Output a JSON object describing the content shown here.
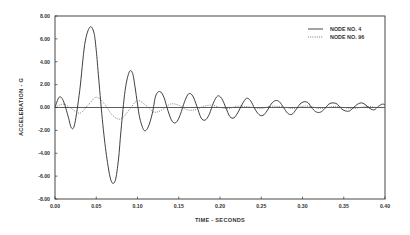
{
  "chart_data": {
    "type": "line",
    "title": "",
    "xlabel": "TIME - SECONDS",
    "ylabel": "ACCELERATION - G",
    "xlim": [
      0.0,
      0.4
    ],
    "ylim": [
      -8.0,
      8.0
    ],
    "grid": false,
    "legend_position": "upper right",
    "x_ticks": [
      "0.00",
      "0.05",
      "0.10",
      "0.15",
      "0.20",
      "0.25",
      "0.30",
      "0.35",
      "0.40"
    ],
    "y_ticks": [
      "8.00",
      "6.00",
      "4.00",
      "2.00",
      "0.00",
      "-2.00",
      "-4.00",
      "-6.00",
      "-8.00"
    ],
    "series": [
      {
        "name": "NODE NO. 4",
        "style": "solid",
        "x": [
          0.0,
          0.005,
          0.01,
          0.016,
          0.02,
          0.024,
          0.03,
          0.036,
          0.042,
          0.047,
          0.05,
          0.053,
          0.058,
          0.063,
          0.068,
          0.073,
          0.077,
          0.08,
          0.085,
          0.09,
          0.094,
          0.097,
          0.1,
          0.103,
          0.108,
          0.113,
          0.118,
          0.122,
          0.127,
          0.132,
          0.137,
          0.142,
          0.147,
          0.152,
          0.157,
          0.162,
          0.167,
          0.172,
          0.177,
          0.182,
          0.187,
          0.192,
          0.197,
          0.202,
          0.207,
          0.212,
          0.217,
          0.222,
          0.227,
          0.232,
          0.237,
          0.242,
          0.247,
          0.252,
          0.257,
          0.262,
          0.267,
          0.272,
          0.277,
          0.282,
          0.287,
          0.292,
          0.297,
          0.302,
          0.307,
          0.312,
          0.317,
          0.322,
          0.327,
          0.332,
          0.337,
          0.342,
          0.347,
          0.352,
          0.357,
          0.362,
          0.367,
          0.372,
          0.377,
          0.382,
          0.387,
          0.392,
          0.397,
          0.4
        ],
        "y": [
          0.0,
          0.9,
          0.6,
          -0.8,
          -1.8,
          -1.4,
          1.5,
          5.5,
          7.0,
          6.6,
          5.0,
          2.5,
          -1.5,
          -4.5,
          -6.4,
          -6.4,
          -4.5,
          -2.0,
          1.5,
          3.1,
          3.0,
          1.8,
          0.3,
          -1.0,
          -2.0,
          -1.7,
          -0.5,
          1.0,
          1.4,
          0.9,
          -0.3,
          -1.2,
          -1.3,
          -0.6,
          0.5,
          1.2,
          1.0,
          0.1,
          -0.9,
          -1.1,
          -0.6,
          0.4,
          1.0,
          0.8,
          0.0,
          -0.8,
          -0.9,
          -0.4,
          0.3,
          0.8,
          0.6,
          -0.1,
          -0.6,
          -0.7,
          -0.3,
          0.3,
          0.6,
          0.5,
          0.0,
          -0.5,
          -0.6,
          -0.2,
          0.3,
          0.5,
          0.4,
          -0.1,
          -0.4,
          -0.4,
          -0.1,
          0.3,
          0.4,
          0.3,
          -0.1,
          -0.3,
          -0.3,
          0.0,
          0.3,
          0.4,
          0.2,
          -0.1,
          -0.2,
          0.1,
          0.3,
          0.2
        ]
      },
      {
        "name": "NODE NO. 96",
        "style": "dotted",
        "x": [
          0.0,
          0.01,
          0.02,
          0.03,
          0.04,
          0.05,
          0.06,
          0.07,
          0.08,
          0.09,
          0.1,
          0.11,
          0.12,
          0.13,
          0.14,
          0.15,
          0.16,
          0.17,
          0.18,
          0.19,
          0.2,
          0.21,
          0.22,
          0.23,
          0.24,
          0.25,
          0.26,
          0.27,
          0.28,
          0.29,
          0.3,
          0.31,
          0.32,
          0.33,
          0.34,
          0.35,
          0.36,
          0.37,
          0.38,
          0.39,
          0.4
        ],
        "y": [
          0.0,
          0.3,
          -0.1,
          -0.5,
          0.2,
          0.9,
          0.3,
          -0.7,
          -1.0,
          -0.2,
          0.6,
          0.2,
          -0.4,
          -0.2,
          0.3,
          0.2,
          -0.2,
          -0.2,
          0.1,
          0.2,
          0.0,
          -0.1,
          0.1,
          0.1,
          0.0,
          -0.1,
          0.1,
          0.1,
          0.0,
          -0.1,
          0.1,
          0.1,
          -0.1,
          0.0,
          0.1,
          0.0,
          -0.1,
          0.0,
          0.1,
          0.0,
          0.0
        ]
      }
    ]
  },
  "legend": {
    "items": [
      {
        "label": "NODE NO. 4",
        "style": "solid"
      },
      {
        "label": "NODE NO. 96",
        "style": "dotted"
      }
    ]
  },
  "axes": {
    "xlabel": "TIME - SECONDS",
    "ylabel": "ACCELERATION - G"
  }
}
